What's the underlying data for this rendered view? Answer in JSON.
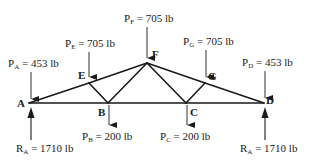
{
  "diagram": {
    "type": "truss",
    "nodes": {
      "A": {
        "label": "A",
        "x": 29,
        "y": 103
      },
      "B": {
        "label": "B",
        "x": 108,
        "y": 103
      },
      "C": {
        "label": "C",
        "x": 186,
        "y": 103
      },
      "D": {
        "label": "D",
        "x": 264,
        "y": 103
      },
      "E": {
        "label": "E",
        "x": 89,
        "y": 83
      },
      "F": {
        "label": "F",
        "x": 147,
        "y": 63
      },
      "G": {
        "label": "G",
        "x": 205,
        "y": 83
      }
    },
    "members": [
      [
        "A",
        "D"
      ],
      [
        "A",
        "E"
      ],
      [
        "E",
        "F"
      ],
      [
        "F",
        "G"
      ],
      [
        "G",
        "D"
      ],
      [
        "E",
        "B"
      ],
      [
        "B",
        "F"
      ],
      [
        "F",
        "C"
      ],
      [
        "C",
        "G"
      ]
    ],
    "loads": {
      "PA": {
        "symbol": "P",
        "sub": "A",
        "value": " = 453 lb"
      },
      "PE": {
        "symbol": "P",
        "sub": "E",
        "value": " = 705 lb"
      },
      "PF": {
        "symbol": "P",
        "sub": "F",
        "value": " = 705 lb"
      },
      "PG": {
        "symbol": "P",
        "sub": "G",
        "value": " = 705 lb"
      },
      "PD": {
        "symbol": "P",
        "sub": "D",
        "value": " = 453 lb"
      },
      "PB": {
        "symbol": "P",
        "sub": "B",
        "value": " = 200 lb"
      },
      "PC": {
        "symbol": "P",
        "sub": "C",
        "value": " = 200 lb"
      }
    },
    "reactions": {
      "left": {
        "symbol": "R",
        "sub": "A",
        "value": " = 1710 lb"
      },
      "right": {
        "symbol": "R",
        "sub": "A",
        "value": " = 1710 lb"
      }
    }
  }
}
